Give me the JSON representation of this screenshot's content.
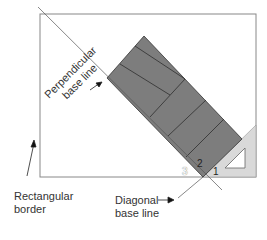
{
  "diagram": {
    "labels": {
      "perpendicular_line1": "Perpendicular",
      "perpendicular_line2": "base line",
      "rectangular_line1": "Rectangular",
      "rectangular_line2": "border",
      "diagonal_line1": "Diagonal",
      "diagonal_line2": "base line"
    },
    "corner_numbers": [
      "1",
      "2",
      "3"
    ],
    "colors": {
      "tile_fill": "#7d7d7d",
      "tile_edge": "#333333",
      "triangle_fill": "#d9d9d9",
      "border": "#777777",
      "line": "#555555"
    }
  }
}
